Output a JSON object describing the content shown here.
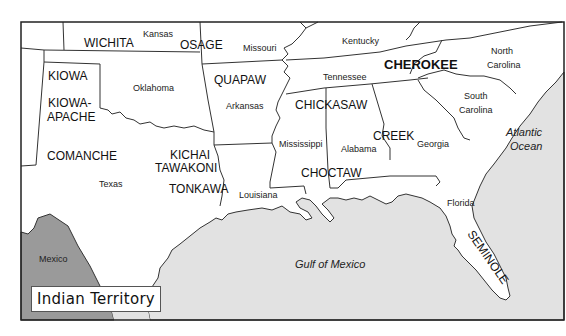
{
  "map": {
    "title": "Indian Territory",
    "colors": {
      "land": "#ffffff",
      "water": "#e2e2e2",
      "mexico": "#9a9a9a",
      "border": "#333333",
      "frame": "#222222"
    },
    "states": [
      {
        "name": "Kansas",
        "label": "Kansas"
      },
      {
        "name": "Missouri",
        "label": "Missouri"
      },
      {
        "name": "Kentucky",
        "label": "Kentucky"
      },
      {
        "name": "Oklahoma",
        "label": "Oklahoma"
      },
      {
        "name": "Arkansas",
        "label": "Arkansas"
      },
      {
        "name": "Tennessee",
        "label": "Tennessee"
      },
      {
        "name": "North Carolina",
        "label_line1": "North",
        "label_line2": "Carolina"
      },
      {
        "name": "South Carolina",
        "label_line1": "South",
        "label_line2": "Carolina"
      },
      {
        "name": "Texas",
        "label": "Texas"
      },
      {
        "name": "Louisiana",
        "label": "Louisiana"
      },
      {
        "name": "Mississippi",
        "label": "Mississippi"
      },
      {
        "name": "Alabama",
        "label": "Alabama"
      },
      {
        "name": "Georgia",
        "label": "Georgia"
      },
      {
        "name": "Florida",
        "label": "Florida"
      },
      {
        "name": "Mexico",
        "label": "Mexico"
      }
    ],
    "tribes": {
      "wichita": "WICHITA",
      "osage": "OSAGE",
      "kiowa": "KIOWA",
      "kiowa_apache_1": "KIOWA-",
      "kiowa_apache_2": "APACHE",
      "comanche": "COMANCHE",
      "kichai_1": "KICHAI",
      "kichai_2": "TAWAKONI",
      "tonkawa": "TONKAWA",
      "quapaw": "QUAPAW",
      "chickasaw": "CHICKASAW",
      "choctaw": "CHOCTAW",
      "creek": "CREEK",
      "cherokee": "CHEROKEE",
      "seminole": "SEMINOLE"
    },
    "water": {
      "gulf": "Gulf of Mexico",
      "atlantic_1": "Atlantic",
      "atlantic_2": "Ocean"
    },
    "labels": {
      "kansas": "Kansas",
      "missouri": "Missouri",
      "kentucky": "Kentucky",
      "oklahoma": "Oklahoma",
      "arkansas": "Arkansas",
      "tennessee": "Tennessee",
      "nc1": "North",
      "nc2": "Carolina",
      "sc1": "South",
      "sc2": "Carolina",
      "texas": "Texas",
      "louisiana": "Louisiana",
      "mississippi": "Mississippi",
      "alabama": "Alabama",
      "georgia": "Georgia",
      "florida": "Florida",
      "mexico": "Mexico"
    }
  }
}
